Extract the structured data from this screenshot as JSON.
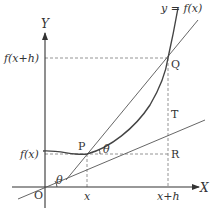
{
  "diagram": {
    "axes": {
      "x_label": "X",
      "y_label": "Y",
      "origin_label": "O"
    },
    "curve_label": "y = f(x)",
    "points": {
      "P": "P",
      "Q": "Q",
      "R": "R",
      "T": "T"
    },
    "tick_labels": {
      "x": "x",
      "x_plus_h": "x+h",
      "fx": "f(x)",
      "fx_plus_h": "f(x+h)"
    },
    "angle_label": "θ",
    "colors": {
      "line": "#444444",
      "curve": "#555555",
      "dashed": "#888888",
      "text": "#333333"
    }
  }
}
